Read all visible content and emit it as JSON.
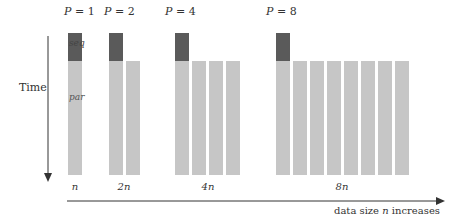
{
  "y_axis": {
    "label": "Time"
  },
  "x_axis": {
    "caption_prefix": "data size ",
    "caption_var": "n",
    "caption_suffix": " increases"
  },
  "bar_labels": {
    "seq": "seq",
    "par": "par"
  },
  "groups": [
    {
      "p_var": "P",
      "p_eq": " = ",
      "p_val": "1",
      "x_label": "n",
      "processors": 1
    },
    {
      "p_var": "P",
      "p_eq": " = ",
      "p_val": "2",
      "x_label": "2n",
      "processors": 2
    },
    {
      "p_var": "P",
      "p_eq": " = ",
      "p_val": "4",
      "x_label": "4n",
      "processors": 4
    },
    {
      "p_var": "P",
      "p_eq": " = ",
      "p_val": "8",
      "x_label": "8n",
      "processors": 8
    }
  ],
  "colors": {
    "seq": "#5a5a5a",
    "par": "#c6c6c6",
    "axis": "#333333"
  }
}
